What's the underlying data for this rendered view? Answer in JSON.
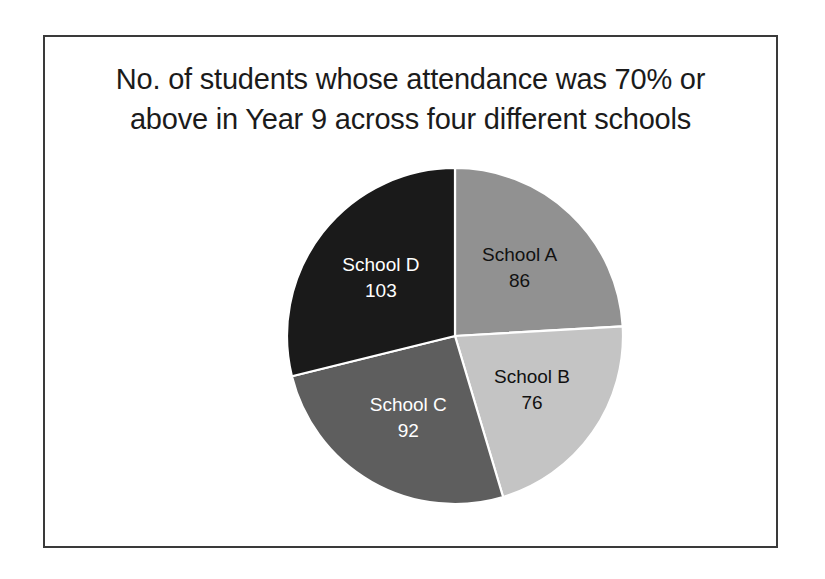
{
  "frame": {
    "border_color": "#3a3a3a",
    "background": "#ffffff"
  },
  "chart_data": {
    "type": "pie",
    "title": "No. of students whose attendance was 70% or above in Year 9 across four different schools",
    "title_line_1": "No. of students whose attendance was 70% or",
    "title_line_2": "above in Year 9 across four different schools",
    "categories": [
      "School A",
      "School B",
      "School C",
      "School D"
    ],
    "values": [
      86,
      76,
      92,
      103
    ],
    "total": 357,
    "start_angle_deg": 0,
    "direction": "clockwise",
    "legend": "none",
    "grid": false,
    "slices": [
      {
        "label": "School A",
        "value": 86,
        "value_text": "86",
        "color": "#919191",
        "text_color": "#111111",
        "angle_deg": 86.7,
        "percent": 24.1
      },
      {
        "label": "School B",
        "value": 76,
        "value_text": "76",
        "color": "#c4c4c4",
        "text_color": "#111111",
        "angle_deg": 76.6,
        "percent": 21.3
      },
      {
        "label": "School C",
        "value": 92,
        "value_text": "92",
        "color": "#5e5e5e",
        "text_color": "#ffffff",
        "angle_deg": 92.8,
        "percent": 25.8
      },
      {
        "label": "School D",
        "value": 103,
        "value_text": "103",
        "color": "#1a1a1a",
        "text_color": "#ffffff",
        "angle_deg": 103.9,
        "percent": 28.9
      }
    ],
    "xlabel": "",
    "ylabel": ""
  }
}
